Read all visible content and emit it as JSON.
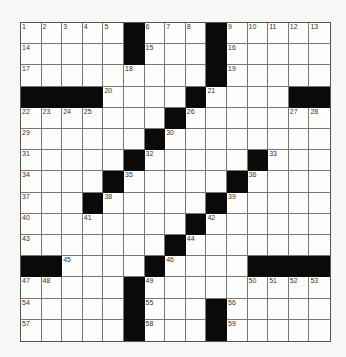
{
  "puzzle": {
    "rows": 15,
    "cols": 15,
    "layout": [
      "1,2,3,4,5,#,6,7,8,#,9,10,11,12,13",
      "14,.,.,.,.,#,15,.,.,#,16,.,.,.,.",
      "17,.,.,.,.,18,.,.,.,#,19,.,.,.,.",
      "#,#,#,#,20,.,.,.,#,21,.,.,.,#,#",
      "22,23,24,25,.,.,.,#,26,.,.,.,.,27,28",
      "29,.,.,.,.,.,#,30,.,.,.,.,.,.,.",
      "31,.,.,.,.,#,32,.,.,.,.,#,33,.,.",
      "34,.,.,.,#,35,.,.,.,.,#,36,.,.,.",
      "37,.,.,#,38,.,.,.,.,#,39,.,.,.,.",
      "40,.,.,41,.,.,.,.,#,42,.,.,.,.,.",
      "43,.,.,.,.,.,.,#,44,.,.,.,.,.,.",
      "#,#,45,.,.,.,#,46,.,.,.,#,#,#,#",
      "47,48,.,.,.,#,49,.,.,.,.,50,51,52,53",
      "54,.,.,.,.,#,55,.,.,#,56,.,.,.,.",
      "57,.,.,.,.,#,58,.,.,#,59,.,.,.,."
    ]
  }
}
